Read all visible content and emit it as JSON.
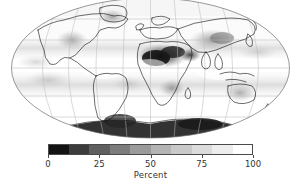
{
  "figure": {
    "type": "global-map-figure",
    "background_color": "#ffffff"
  },
  "map": {
    "name": "global-cloud-cover-map",
    "projection": "Mollweide",
    "graticule": {
      "meridian_spacing_deg": 30,
      "parallel_spacing_deg": 30,
      "line_color": "#b9b9b9"
    },
    "coastline_color": "#1a1a1a",
    "ocean_base_color": "#fbfbfb"
  },
  "colorbar": {
    "name": "percent-colorbar",
    "orientation": "horizontal",
    "title": "Percent",
    "vmin": 0,
    "vmax": 100,
    "tick_labels": [
      "0",
      "25",
      "50",
      "75",
      "100"
    ],
    "tick_values": [
      0,
      25,
      50,
      75,
      100
    ],
    "discrete": true,
    "n_levels": 10,
    "swatch_colors": [
      "#131313",
      "#3c3c3c",
      "#5f5f5f",
      "#7c7c7c",
      "#9b9b9b",
      "#b4b4b4",
      "#c9c9c9",
      "#dcdcdc",
      "#eeeeee",
      "#ffffff"
    ],
    "frame_color": "#4a4a4a"
  },
  "chart_data": {
    "type": "heatmap",
    "title": "",
    "subtitle": "",
    "xlabel": "",
    "ylabel": "",
    "colorbar_label": "Percent",
    "projection": "Mollweide",
    "colormap": "grayscale (black = 0%, white = 100%)",
    "vmin": 0,
    "vmax": 100,
    "tick_labels": [
      "0",
      "25",
      "50",
      "75",
      "100"
    ],
    "grid": true,
    "legend_position": "bottom",
    "regions": [
      {
        "name": "Sahara / North Africa",
        "approx_percent": 5
      },
      {
        "name": "Arabian Peninsula",
        "approx_percent": 10
      },
      {
        "name": "Antarctica",
        "approx_percent": 8
      },
      {
        "name": "Southern Africa interior",
        "approx_percent": 25
      },
      {
        "name": "Australia interior",
        "approx_percent": 40
      },
      {
        "name": "Central Asia",
        "approx_percent": 30
      },
      {
        "name": "Subtropical south Pacific",
        "approx_percent": 45
      },
      {
        "name": "Subtropical south Atlantic",
        "approx_percent": 45
      },
      {
        "name": "Western North America",
        "approx_percent": 45
      },
      {
        "name": "Greenland",
        "approx_percent": 35
      },
      {
        "name": "Amazon basin",
        "approx_percent": 80
      },
      {
        "name": "Equatorial Pacific ITCZ",
        "approx_percent": 90
      },
      {
        "name": "Southern Ocean storm belt",
        "approx_percent": 95
      },
      {
        "name": "North Atlantic high latitudes",
        "approx_percent": 92
      },
      {
        "name": "Maritime Continent",
        "approx_percent": 85
      }
    ]
  }
}
